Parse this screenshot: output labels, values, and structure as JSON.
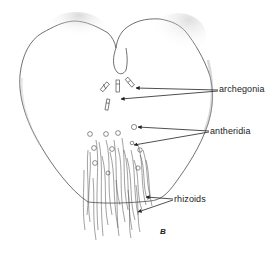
{
  "figure": {
    "panel_letter": "B",
    "line_color": "#333333",
    "stipple_color": "#888888",
    "labels": [
      {
        "id": "archegonia",
        "text": "archegonia",
        "x": 219,
        "y": 85
      },
      {
        "id": "antheridia",
        "text": "antheridia",
        "x": 210,
        "y": 128
      },
      {
        "id": "rhizoids",
        "text": "rhizoids",
        "x": 174,
        "y": 196
      }
    ]
  }
}
